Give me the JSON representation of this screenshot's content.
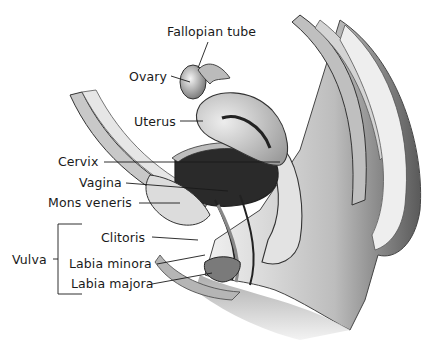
{
  "figure": {
    "type": "anatomical-illustration",
    "labels": {
      "fallopian_tube": "Fallopian tube",
      "ovary": "Ovary",
      "uterus": "Uterus",
      "cervix": "Cervix",
      "vagina": "Vagina",
      "mons_veneris": "Mons veneris",
      "clitoris": "Clitoris",
      "labia_minora": "Labia minora",
      "labia_majora": "Labia majora",
      "vulva": "Vulva"
    },
    "vulva_group": [
      "Clitoris",
      "Labia minora",
      "Labia majora"
    ]
  }
}
